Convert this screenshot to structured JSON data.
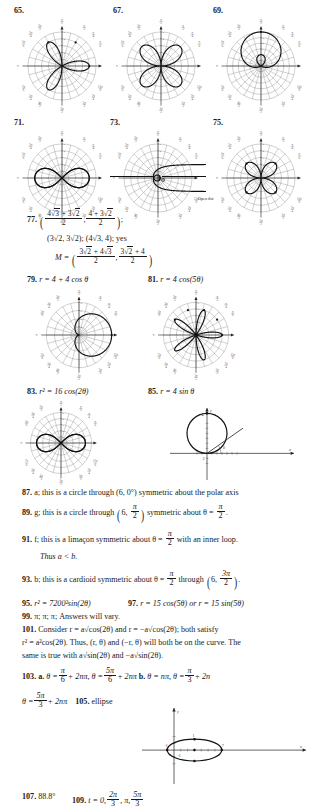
{
  "page": {
    "background": "#ffffff",
    "ink": "#1a1a1a",
    "grid_color": "#8c8c8c",
    "curve_color": "#111111"
  },
  "polar_graphs": [
    {
      "number": "65.",
      "x": 14,
      "y": 18,
      "size": 96,
      "equation_type": "rose",
      "formula": "r = 4 cos(3theta)",
      "a": 4,
      "k": 3,
      "func": "cos",
      "rmax": 5,
      "rings": 5,
      "spokes": 24,
      "label_rings": true
    },
    {
      "number": "67.",
      "x": 113,
      "y": 18,
      "size": 96,
      "equation_type": "lemniscate-rose",
      "formula": "r = 4 sin(2theta)",
      "a": 4,
      "k": 2,
      "func": "sin",
      "rmax": 5,
      "rings": 5,
      "spokes": 24,
      "label_rings": true
    },
    {
      "number": "69.",
      "x": 213,
      "y": 18,
      "size": 96,
      "equation_type": "limacon-inner-loop",
      "formula": "r = 2 + 4 sin(theta)",
      "a": 2,
      "b": 4,
      "func": "sin",
      "rmax": 6,
      "rings": 6,
      "spokes": 24,
      "label_rings": true
    },
    {
      "number": "71.",
      "x": 14,
      "y": 130,
      "size": 96,
      "equation_type": "lemniscate",
      "formula": "r^2 = 16 cos(2theta)",
      "a": 4,
      "k": 2,
      "func": "cos",
      "rmax": 5,
      "rings": 5,
      "spokes": 24,
      "label_rings": true
    },
    {
      "number": "73.",
      "x": 110,
      "y": 130,
      "size": 96,
      "equation_type": "spiral-hyperbolic",
      "formula": "r = 2 / theta",
      "a": 2,
      "rmax": 5,
      "rings": 5,
      "spokes": 24,
      "label_rings": true,
      "annotation": "Open dot"
    },
    {
      "number": "75.",
      "x": 213,
      "y": 130,
      "size": 96,
      "equation_type": "rose",
      "formula": "r = 3 sin(2theta)",
      "a": 3,
      "k": 2,
      "func": "sin",
      "rmax": 5,
      "rings": 5,
      "spokes": 24,
      "label_rings": true
    },
    {
      "number": "",
      "x": 33,
      "y": 289,
      "size": 92,
      "equation_type": "cardioid",
      "formula": "r = 4 + 4 cos(theta)",
      "a": 4,
      "b": 4,
      "func": "cos",
      "rmax": 8,
      "rings": 4,
      "spokes": 24,
      "label_rings": true
    },
    {
      "number": "",
      "x": 150,
      "y": 289,
      "size": 92,
      "equation_type": "rose",
      "formula": "r = 4 cos(5theta)",
      "a": 4,
      "k": 5,
      "func": "cos",
      "rmax": 5,
      "rings": 5,
      "spokes": 24,
      "label_rings": true
    },
    {
      "number": "",
      "x": 18,
      "y": 400,
      "size": 86,
      "equation_type": "lemniscate",
      "formula": "r^2 = 16 cos(2theta)",
      "a": 4,
      "k": 2,
      "func": "cos",
      "rmax": 5,
      "rings": 5,
      "spokes": 24,
      "label_rings": true
    }
  ],
  "cartesian_graphs": [
    {
      "name": "circle-r-4-sin-theta",
      "x": 168,
      "y": 405,
      "width": 130,
      "height": 78,
      "type": "circle",
      "center": [
        0,
        2
      ],
      "radius": 2,
      "tick_labels": [
        "2",
        "4"
      ],
      "axis_labels": {
        "x": "x",
        "y": "y"
      },
      "ray_angle_deg": 35,
      "ray_label": "theta"
    },
    {
      "name": "ellipse-graph",
      "x": 140,
      "y": 705,
      "width": 170,
      "height": 82,
      "type": "ellipse",
      "center": [
        3,
        0
      ],
      "a": 4,
      "b": 1.6,
      "x_tick_labels": [
        "-1",
        "7"
      ],
      "y_tick_labels": [
        "1",
        "-1"
      ],
      "axis_labels": {
        "x": "x",
        "y": "y"
      }
    }
  ],
  "answers": {
    "a77": {
      "number": "77.",
      "line1_num1": "4",
      "line1_rad1": "3",
      "line1_plus": "+",
      "line1_num2": "3",
      "line1_rad2": "2",
      "line1_den": "2",
      "line1b_num1": "4",
      "line1b_plus": "+",
      "line1b_num2": "3",
      "line1b_rad": "2",
      "line1b_den": "2",
      "line2": "(3√2, 3√2); (4√3, 4); yes",
      "line3_lead": "M =",
      "line3_num_a": "3",
      "line3_rad_a": "2",
      "line3_plus_a": "+",
      "line3_num_b": "4",
      "line3_rad_b": "3",
      "line3_den_a": "2",
      "line3_num_c": "3",
      "line3_rad_c": "2",
      "line3_plus_c": "+",
      "line3_num_d": "4",
      "line3_den_b": "2"
    },
    "a79": {
      "number": "79.",
      "text": "r = 4 + 4 cos θ"
    },
    "a81": {
      "number": "81.",
      "text": "r = 4 cos(5θ)"
    },
    "a83": {
      "number": "83.",
      "text": "r² = 16 cos(2θ)"
    },
    "a85": {
      "number": "85.",
      "text": "r = 4 sin θ"
    },
    "a87": {
      "number": "87.",
      "text": "a; this is a circle through (6, 0°) symmetric about the polar axis"
    },
    "a89": {
      "number": "89.",
      "pre": "g; this is a circle through",
      "point_r": "6",
      "point_num": "π",
      "point_den": "2",
      "mid": "symmetric about θ =",
      "end_num": "π",
      "end_den": "2",
      "tail": "."
    },
    "a91": {
      "number": "91.",
      "pre": "f; this is a limaçon symmetric about θ =",
      "num": "π",
      "den": "2",
      "post": "with an inner loop.",
      "line2": "Thus a < b."
    },
    "a93": {
      "number": "93.",
      "pre": "b; this is a cardioid symmetric about θ =",
      "num": "π",
      "den": "2",
      "mid": "through",
      "point_r": "6",
      "point_num": "3π",
      "point_den": "2",
      "tail": "."
    },
    "a95": {
      "number": "95.",
      "text": "r² = 7200²sin(2θ)"
    },
    "a97": {
      "number": "97.",
      "text": "r = 15 cos(5θ) or r = 15 sin(5θ)"
    },
    "a99": {
      "number": "99.",
      "text": "π; π; π; Answers will vary."
    },
    "a101": {
      "number": "101.",
      "line1": "Consider r = a√cos(2θ) and r = −a√cos(2θ); both satisfy",
      "line2": "r² = a²cos(2θ). Thus, (r, θ) and (−r, θ) will both be on the curve. The",
      "line3": "same is true with a√sin(2θ) and −a√sin(2θ)."
    },
    "a103": {
      "number": "103.",
      "part_a_label": "a.",
      "a_first_lead": "θ =",
      "a_first_num": "π",
      "a_first_den": "6",
      "a_first_tail": "+ 2nπ,",
      "a_second_lead": "θ =",
      "a_second_num": "5π",
      "a_second_den": "6",
      "a_second_tail": "+ 2nπ",
      "part_b_label": "b.",
      "b_first": "θ = nπ,",
      "b_second_lead": "θ =",
      "b_second_num": "π",
      "b_second_den": "3",
      "b_second_tail": "+ 2n",
      "line2_lead": "θ =",
      "line2_num": "5π",
      "line2_den": "3",
      "line2_tail": "+ 2nπ"
    },
    "a105": {
      "number": "105.",
      "text": "ellipse"
    },
    "a107": {
      "number": "107.",
      "text": "88.8°"
    },
    "a109": {
      "number": "109.",
      "lead": "t = 0,",
      "f1_num": "2π",
      "f1_den": "3",
      "mid": ", π,",
      "f2_num": "5π",
      "f2_den": "3"
    }
  }
}
